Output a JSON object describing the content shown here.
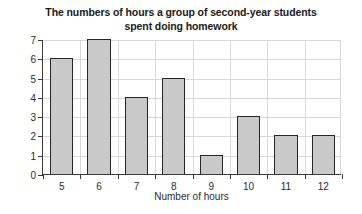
{
  "chart_data": {
    "type": "bar",
    "title": "The numbers of hours a group of second-year students spent doing homework",
    "title_lines": [
      "The numbers of hours a group of second-year students",
      "spent doing homework"
    ],
    "xlabel": "Number of hours",
    "ylabel": "Frequency",
    "categories": [
      5,
      6,
      7,
      8,
      9,
      10,
      11,
      12
    ],
    "values": [
      6,
      7,
      4,
      5,
      1,
      3,
      2,
      2
    ],
    "ylim": [
      0,
      7
    ],
    "ytick_labels": [
      "0",
      "1",
      "2",
      "3",
      "4",
      "5",
      "6",
      "7"
    ],
    "xtick_labels": [
      "5",
      "6",
      "7",
      "8",
      "9",
      "10",
      "11",
      "12"
    ],
    "grid": "both",
    "legend": "none",
    "bar_fill_color": "#c9c9c9",
    "bar_edge_color": "#262626",
    "grid_color": "#d8d8d8",
    "axis_color": "#3a3a3a",
    "text_color": "#2b2b2b",
    "title_color": "#1a1a1a",
    "background_color": "#ffffff"
  }
}
